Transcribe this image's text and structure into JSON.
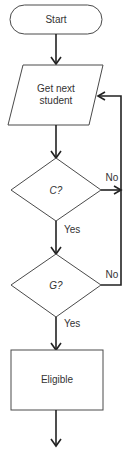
{
  "flowchart": {
    "nodes": [
      {
        "id": "start",
        "type": "terminal",
        "label": "Start"
      },
      {
        "id": "get",
        "type": "io",
        "label_lines": [
          "Get next",
          "student"
        ]
      },
      {
        "id": "c",
        "type": "decision",
        "label": "C?"
      },
      {
        "id": "g",
        "type": "decision",
        "label": "G?"
      },
      {
        "id": "eligible",
        "type": "process",
        "label": "Eligible"
      }
    ],
    "edges": [
      {
        "from": "start",
        "to": "get",
        "label": ""
      },
      {
        "from": "get",
        "to": "c",
        "label": ""
      },
      {
        "from": "c",
        "to": "g",
        "label": "Yes"
      },
      {
        "from": "c",
        "to": "get",
        "label": "No"
      },
      {
        "from": "g",
        "to": "eligible",
        "label": "Yes"
      },
      {
        "from": "g",
        "to": "get",
        "label": "No"
      },
      {
        "from": "eligible",
        "to": "",
        "label": ""
      }
    ],
    "labels": {
      "start": "Start",
      "get_line1": "Get next",
      "get_line2": "student",
      "c": "C?",
      "g": "G?",
      "eligible": "Eligible",
      "c_no": "No",
      "c_yes": "Yes",
      "g_no": "No",
      "g_yes": "Yes"
    }
  }
}
